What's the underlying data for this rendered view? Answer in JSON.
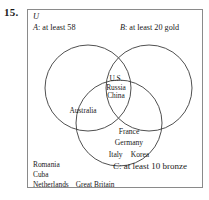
{
  "problem": {
    "number": "15."
  },
  "diagram": {
    "type": "venn-3-set",
    "universe_label": "U",
    "sets": [
      {
        "key": "A",
        "label_prefix": "A",
        "label_text": ": at least 58",
        "full_label": "A: at least 58"
      },
      {
        "key": "B",
        "label_prefix": "B",
        "label_text": ": at least 20 gold",
        "full_label": "B: at least 20 gold"
      },
      {
        "key": "C",
        "label_prefix": "C",
        "label_text": ": at least 10 bronze",
        "full_label": "C: at least 10 bronze"
      }
    ],
    "regions": {
      "a_b_c": {
        "name": "A and B and C",
        "items": [
          "U.S.",
          "Russia",
          "China"
        ]
      },
      "a_c": {
        "name": "A and C only",
        "items": [
          "Australia"
        ]
      },
      "c_only": {
        "name": "C only",
        "items": [
          "France",
          "Germany",
          "Italy",
          "Korea"
        ]
      },
      "outside": {
        "name": "outside all sets",
        "items": [
          "Romania",
          "Cuba",
          "Netherlands",
          "Great Britain"
        ]
      }
    },
    "colors": {
      "circle_stroke": "#3c3c3c",
      "box_border": "#8a8a8a",
      "background": "#ffffff",
      "text": "#1a1a1a"
    },
    "circles": {
      "A": {
        "cx": 60,
        "cy": 78,
        "r": 43
      },
      "B": {
        "cx": 121,
        "cy": 78,
        "r": 43
      },
      "C": {
        "cx": 91,
        "cy": 113,
        "r": 43
      }
    }
  },
  "region_text": {
    "abc_line1": "U.S.",
    "abc_line2": "Russia",
    "abc_line3": "China",
    "ac_line1": "Australia",
    "c_line1": "France",
    "c_line2": "Germany",
    "c_line3a": "Italy",
    "c_line3b": "Korea",
    "out_line1": "Romania",
    "out_line2": "Cuba",
    "out_line3a": "Netherlands",
    "out_line3b": "Great Britain"
  }
}
